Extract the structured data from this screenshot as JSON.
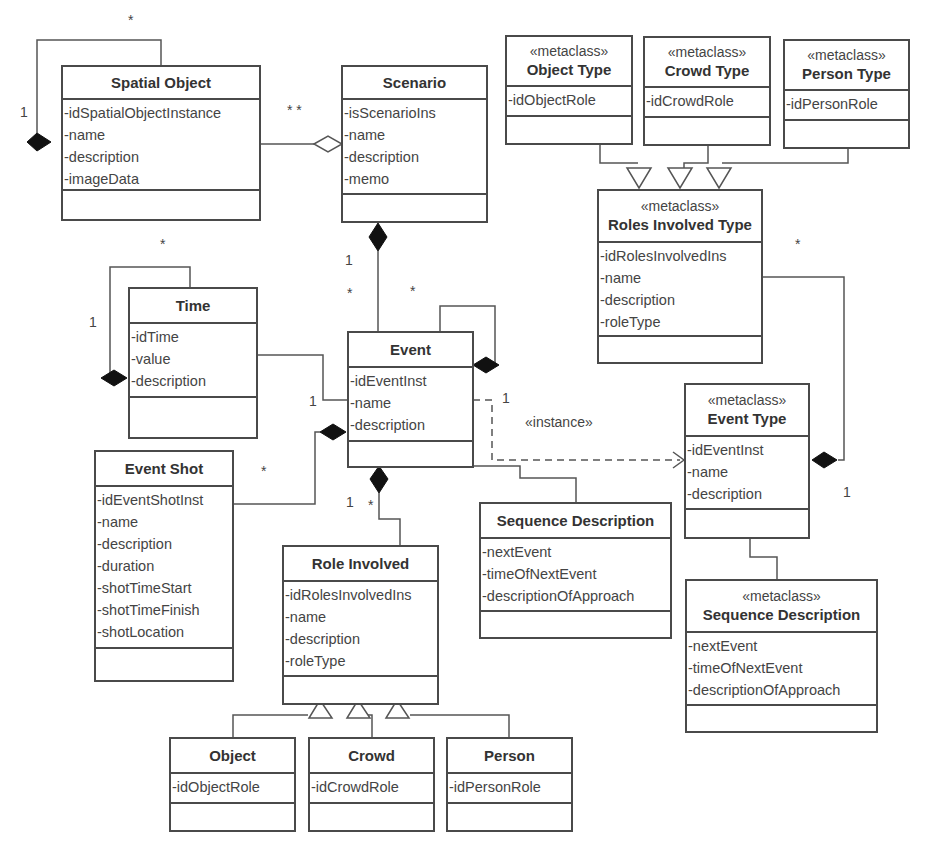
{
  "diagram": {
    "type": "UML class diagram",
    "classes": {
      "spatial_object": {
        "name": "Spatial Object",
        "attrs": [
          "-idSpatialObjectInstance",
          "-name",
          "-description",
          "-imageData"
        ]
      },
      "scenario": {
        "name": "Scenario",
        "attrs": [
          "-isScenarioIns",
          "-name",
          "-description",
          "-memo"
        ]
      },
      "object_type": {
        "stereotype": "«metaclass»",
        "name": "Object Type",
        "attrs": [
          "-idObjectRole"
        ]
      },
      "crowd_type": {
        "stereotype": "«metaclass»",
        "name": "Crowd Type",
        "attrs": [
          "-idCrowdRole"
        ]
      },
      "person_type": {
        "stereotype": "«metaclass»",
        "name": "Person Type",
        "attrs": [
          "-idPersonRole"
        ]
      },
      "roles_involved_type": {
        "stereotype": "«metaclass»",
        "name": "Roles Involved Type",
        "attrs": [
          "-idRolesInvolvedIns",
          "-name",
          "-description",
          "-roleType"
        ]
      },
      "time": {
        "name": "Time",
        "attrs": [
          "-idTime",
          "-value",
          "-description"
        ]
      },
      "event": {
        "name": "Event",
        "attrs": [
          "-idEventInst",
          "-name",
          "-description"
        ]
      },
      "event_type": {
        "stereotype": "«metaclass»",
        "name": "Event Type",
        "attrs": [
          "-idEventInst",
          "-name",
          "-description"
        ]
      },
      "event_shot": {
        "name": "Event Shot",
        "attrs": [
          "-idEventShotInst",
          "-name",
          "-description",
          "-duration",
          "-shotTimeStart",
          "-shotTimeFinish",
          "-shotLocation"
        ]
      },
      "sequence_description": {
        "name": "Sequence Description",
        "attrs": [
          "-nextEvent",
          "-timeOfNextEvent",
          "-descriptionOfApproach"
        ]
      },
      "sequence_description_meta": {
        "stereotype": "«metaclass»",
        "name": "Sequence Description",
        "attrs": [
          "-nextEvent",
          "-timeOfNextEvent",
          "-descriptionOfApproach"
        ]
      },
      "role_involved": {
        "name": "Role Involved",
        "attrs": [
          "-idRolesInvolvedIns",
          "-name",
          "-description",
          "-roleType"
        ]
      },
      "object": {
        "name": "Object",
        "attrs": [
          "-idObjectRole"
        ]
      },
      "crowd": {
        "name": "Crowd",
        "attrs": [
          "-idCrowdRole"
        ]
      },
      "person": {
        "name": "Person",
        "attrs": [
          "-idPersonRole"
        ]
      }
    },
    "labels": {
      "spatial_self_star": "*",
      "spatial_self_one": "1",
      "spatial_scenario_stars": "*  *",
      "time_self_star": "*",
      "time_self_one": "1",
      "scenario_event_one": "1",
      "scenario_event_star": "*",
      "event_self_star": "*",
      "time_event_one": "1",
      "event_type_one": "1",
      "instance": "«instance»",
      "event_shot_star": "*",
      "role_one": "1",
      "role_star": "*",
      "roles_type_star": "*",
      "event_type_roles_one": "1"
    }
  }
}
